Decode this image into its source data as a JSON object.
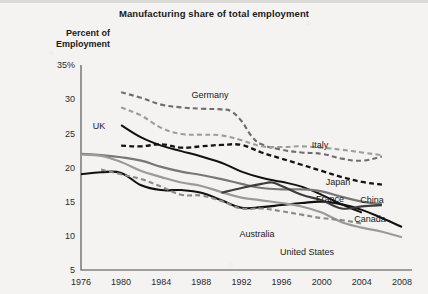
{
  "chart_data": {
    "type": "line",
    "title": "Manufacturing share of total employment",
    "xlabel": "",
    "ylabel": "Percent of Employment",
    "xlim": [
      1976,
      2009
    ],
    "ylim": [
      5,
      35
    ],
    "grid": false,
    "legend_position": "inline-labels",
    "x_ticks": [
      "1976",
      "1980",
      "1984",
      "1988",
      "1992",
      "1996",
      "2000",
      "2004",
      "2008"
    ],
    "y_ticks": [
      "35%",
      "30",
      "25",
      "20",
      "15",
      "10",
      "5"
    ],
    "series": [
      {
        "name": "Germany",
        "style": "dashed",
        "color": "#6e6e6e",
        "width": 2.1,
        "x": [
          1980,
          1982,
          1984,
          1986,
          1988,
          1990,
          1991,
          1992,
          1993,
          1994,
          1996,
          1998,
          2000,
          2002,
          2004,
          2006
        ],
        "values": [
          31.0,
          30.2,
          29.2,
          28.8,
          28.6,
          28.5,
          28.2,
          26.8,
          24.6,
          23.4,
          22.6,
          22.2,
          22.0,
          21.3,
          21.0,
          21.6
        ]
      },
      {
        "name": "Italy",
        "style": "dashed",
        "color": "#9d9d9d",
        "width": 2.1,
        "x": [
          1980,
          1982,
          1984,
          1986,
          1988,
          1990,
          1992,
          1994,
          1996,
          1998,
          2000,
          2002,
          2004,
          2006
        ],
        "values": [
          28.8,
          27.6,
          25.8,
          24.9,
          24.8,
          24.7,
          24.0,
          23.1,
          23.0,
          23.1,
          22.9,
          22.6,
          22.2,
          21.8
        ]
      },
      {
        "name": "UK",
        "style": "solid",
        "color": "#111111",
        "width": 2.0,
        "x": [
          1980,
          1982,
          1984,
          1986,
          1988,
          1990,
          1992,
          1994,
          1996,
          1998,
          2000,
          2002,
          2004
        ],
        "values": [
          26.2,
          24.4,
          23.2,
          22.4,
          21.6,
          20.7,
          19.4,
          18.5,
          17.9,
          17.2,
          16.0,
          14.6,
          13.4
        ]
      },
      {
        "name": "Japan",
        "style": "dashed",
        "color": "#141414",
        "width": 2.3,
        "x": [
          1980,
          1982,
          1984,
          1986,
          1988,
          1990,
          1992,
          1994,
          1996,
          1998,
          2000,
          2002,
          2004,
          2006
        ],
        "values": [
          23.2,
          23.1,
          23.4,
          22.9,
          23.1,
          23.3,
          23.3,
          22.2,
          21.3,
          20.4,
          19.5,
          18.6,
          17.9,
          17.5
        ]
      },
      {
        "name": "France",
        "style": "solid",
        "color": "#777777",
        "width": 2.2,
        "x": [
          1976,
          1978,
          1980,
          1982,
          1984,
          1986,
          1988,
          1990,
          1992,
          1994,
          1996,
          1998,
          2000,
          2002,
          2004,
          2006
        ],
        "values": [
          22.0,
          21.8,
          21.5,
          21.0,
          20.1,
          19.4,
          18.9,
          18.3,
          17.6,
          17.0,
          16.8,
          16.8,
          16.5,
          15.7,
          15.0,
          14.6
        ]
      },
      {
        "name": "Canada",
        "style": "solid",
        "color": "#111111",
        "width": 2.1,
        "x": [
          1976,
          1978,
          1980,
          1982,
          1984,
          1986,
          1988,
          1990,
          1992,
          1994,
          1996,
          1998,
          2000,
          2002,
          2004,
          2006,
          2008
        ],
        "values": [
          19.0,
          19.3,
          19.2,
          17.4,
          16.7,
          16.7,
          16.3,
          15.2,
          14.1,
          14.2,
          14.5,
          14.8,
          15.0,
          14.6,
          13.8,
          12.6,
          11.3
        ]
      },
      {
        "name": "United States",
        "style": "solid",
        "color": "#9a9a9a",
        "width": 2.2,
        "x": [
          1976,
          1978,
          1980,
          1982,
          1984,
          1986,
          1988,
          1990,
          1992,
          1994,
          1996,
          1998,
          2000,
          2002,
          2004,
          2006,
          2008
        ],
        "values": [
          21.9,
          21.7,
          20.8,
          19.5,
          18.6,
          17.8,
          17.3,
          16.4,
          15.6,
          15.2,
          14.8,
          14.3,
          13.4,
          12.0,
          11.2,
          10.6,
          9.8
        ]
      },
      {
        "name": "Australia",
        "style": "dashed",
        "color": "#8a8a8a",
        "width": 2.1,
        "x": [
          1978,
          1980,
          1982,
          1984,
          1986,
          1988,
          1990,
          1992,
          1994,
          1996,
          1998,
          2000,
          2002,
          2004
        ],
        "values": [
          19.7,
          19.0,
          18.3,
          17.2,
          16.0,
          15.9,
          15.1,
          14.0,
          14.0,
          13.6,
          13.1,
          12.6,
          12.3,
          11.8
        ]
      },
      {
        "name": "China",
        "style": "solid",
        "color": "#3d3d3d",
        "width": 2.2,
        "x": [
          1990,
          1992,
          1994,
          1995,
          1996,
          1998,
          2000,
          2002,
          2004,
          2006
        ],
        "values": [
          16.3,
          17.0,
          17.6,
          17.8,
          17.3,
          16.0,
          15.2,
          14.0,
          14.3,
          14.5
        ]
      }
    ],
    "annotations": [
      {
        "text": "Germany",
        "x": 210,
        "y": 98
      },
      {
        "text": "Italy",
        "x": 320,
        "y": 148
      },
      {
        "text": "UK",
        "x": 99,
        "y": 129
      },
      {
        "text": "Japan",
        "x": 338,
        "y": 185
      },
      {
        "text": "France",
        "x": 330,
        "y": 202
      },
      {
        "text": "China",
        "x": 372,
        "y": 203
      },
      {
        "text": "Canada",
        "x": 370,
        "y": 222
      },
      {
        "text": "Australia",
        "x": 257,
        "y": 237
      },
      {
        "text": "United States",
        "x": 307,
        "y": 255
      }
    ]
  }
}
